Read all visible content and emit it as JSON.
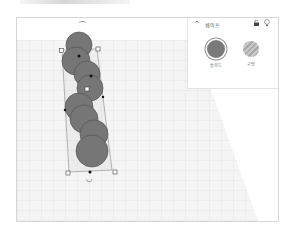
{
  "panel": {
    "title": "쉐이프",
    "collapse_icon": "chevron-up-icon",
    "lock_icon": "lock-icon",
    "light_icon": "lightbulb-icon",
    "shapes": [
      {
        "label": "솔리드",
        "type": "solid",
        "color": "#7a7a7a"
      },
      {
        "label": "구멍",
        "type": "hole",
        "color": "#b5b5b5"
      }
    ]
  },
  "workplane": {
    "rotate_top_icon": "rotate-arrow-icon",
    "rotate_bottom_icon": "rotate-arrow-icon",
    "object": {
      "name": "stacked-spheres-group",
      "sphere_count": 8,
      "sphere_color": "#777777"
    }
  }
}
